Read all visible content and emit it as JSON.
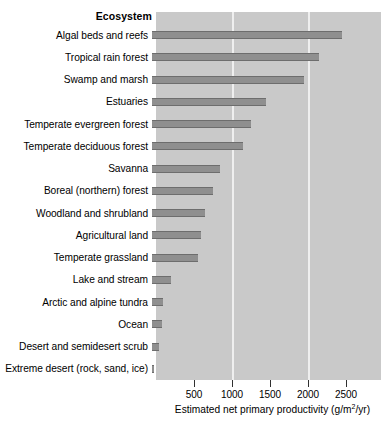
{
  "header": {
    "label": "Ecosystem"
  },
  "axis": {
    "title_prefix": "Estimated net primary productivity (g/m",
    "title_exponent": "2",
    "title_suffix": "/yr)",
    "tick_labels": [
      "500",
      "1000",
      "1500",
      "2000",
      "2500"
    ]
  },
  "colors": {
    "panel_background": "#c9c9c9",
    "gridline": "#efefef",
    "bar_fill": "#8f8f8f",
    "bar_edge": "#6d6d6d",
    "text": "#000000",
    "page_background": "#ffffff"
  },
  "chart_data": {
    "type": "bar",
    "orientation": "horizontal",
    "title": "",
    "subtitle": "",
    "xlabel": "Estimated net primary productivity (g/m2/yr)",
    "ylabel": "Ecosystem",
    "xlim": [
      0,
      2960
    ],
    "xticks": [
      500,
      1000,
      1500,
      2000,
      2500
    ],
    "gridlines": [
      1000,
      2000
    ],
    "grid": true,
    "legend": null,
    "categories": [
      "Algal beds and reefs",
      "Tropical rain forest",
      "Swamp and marsh",
      "Estuaries",
      "Temperate evergreen forest",
      "Temperate deciduous forest",
      "Savanna",
      "Boreal (northern) forest",
      "Woodland and shrubland",
      "Agricultural land",
      "Temperate grassland",
      "Lake and stream",
      "Arctic and alpine tundra",
      "Ocean",
      "Desert and semidesert scrub",
      "Extreme desert (rock, sand, ice)"
    ],
    "values": [
      2500,
      2200,
      2000,
      1500,
      1300,
      1200,
      900,
      800,
      700,
      650,
      600,
      250,
      140,
      125,
      90,
      3
    ]
  }
}
